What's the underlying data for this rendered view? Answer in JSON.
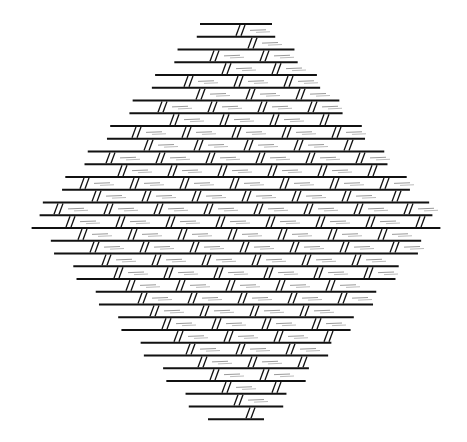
{
  "figure": {
    "width": 467,
    "height": 442,
    "background": "#ffffff",
    "stroke": "#111111",
    "center_x": 236,
    "first_row_y": 24,
    "row_spacing": 12.75,
    "row_count": 32,
    "top_half_width": 32,
    "max_half_width": 206,
    "strand_spacing": 50,
    "strand_shift_per_row": 12,
    "strand_width": 5,
    "strand_slant": 4
  }
}
